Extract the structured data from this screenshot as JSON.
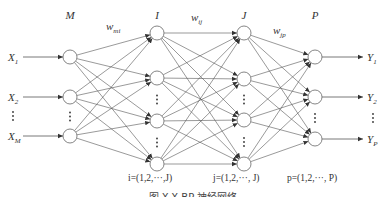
{
  "figure": {
    "caption": "图 X-X  BP 神经网络",
    "colors": {
      "line": "#555555",
      "node_stroke": "#666666",
      "text": "#333333"
    },
    "node_radius": 7,
    "layers": [
      {
        "id": "M",
        "label": "M",
        "x": 70,
        "label_y": 19,
        "nodes": [
          57,
          97,
          136
        ],
        "dots_between": [
          [
            97,
            136
          ]
        ]
      },
      {
        "id": "I",
        "label": "I",
        "x": 157,
        "label_y": 19,
        "nodes": [
          33,
          78,
          121,
          164
        ],
        "dots_between": [
          [
            78,
            121
          ],
          [
            121,
            164
          ]
        ]
      },
      {
        "id": "J",
        "label": "J",
        "x": 244,
        "label_y": 19,
        "nodes": [
          33,
          79,
          120,
          164
        ],
        "dots_between": [
          [
            79,
            120
          ],
          [
            120,
            164
          ]
        ]
      },
      {
        "id": "P",
        "label": "P",
        "x": 315,
        "label_y": 19,
        "nodes": [
          57,
          97,
          139
        ],
        "dots_between": [
          [
            97,
            139
          ]
        ]
      }
    ],
    "weights": [
      {
        "main": "w",
        "sub": "mi",
        "x": 106,
        "y": 30
      },
      {
        "main": "w",
        "sub": "ij",
        "x": 191,
        "y": 21
      },
      {
        "main": "w",
        "sub": "jp",
        "x": 273,
        "y": 34
      }
    ],
    "inputs": [
      {
        "main": "X",
        "sub": "1",
        "y": 57
      },
      {
        "main": "X",
        "sub": "2",
        "y": 97
      },
      {
        "main": "X",
        "sub": "M",
        "y": 136
      }
    ],
    "outputs": [
      {
        "main": "Y",
        "sub": "1",
        "y": 57
      },
      {
        "main": "Y",
        "sub": "2",
        "y": 97
      },
      {
        "main": "Y",
        "sub": "P",
        "y": 139
      }
    ],
    "index_labels": [
      {
        "text": "i=(1,2,···,J)",
        "x": 128,
        "y": 181
      },
      {
        "text": "j=(1,2,···, J)",
        "x": 213,
        "y": 181
      },
      {
        "text": "p=(1,2,···, P)",
        "x": 287,
        "y": 181
      }
    ]
  }
}
